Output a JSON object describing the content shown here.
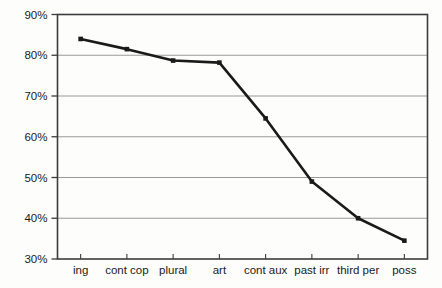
{
  "chart_data": {
    "type": "line",
    "title": "",
    "subtitle": "",
    "xlabel": "",
    "ylabel": "",
    "categories": [
      "ing",
      "cont cop",
      "plural",
      "art",
      "cont aux",
      "past irr",
      "third per",
      "poss"
    ],
    "values": [
      84,
      81.5,
      78.7,
      78.2,
      64.5,
      49,
      40,
      34.5
    ],
    "series": [
      {
        "name": "",
        "values": [
          84,
          81.5,
          78.7,
          78.2,
          64.5,
          49,
          40,
          34.5
        ]
      }
    ],
    "ylim": [
      30,
      90
    ],
    "ytick_values": [
      30,
      40,
      50,
      60,
      70,
      80,
      90
    ],
    "ytick_labels": [
      "30%",
      "40%",
      "50%",
      "60%",
      "70%",
      "80%",
      "90%"
    ],
    "grid": true,
    "grid_axis": "y",
    "legend": false,
    "legend_position": "none",
    "marker": "square",
    "line_color": "#1a1a1a",
    "marker_color": "#1a1a1a",
    "grid_color": "#9a9a9a",
    "axis_color": "#3c3c3c",
    "background_color": "#fdfdfc",
    "annotations": []
  },
  "axes": {
    "y_axis_name": "percentage-axis",
    "x_axis_name": "category-axis"
  }
}
